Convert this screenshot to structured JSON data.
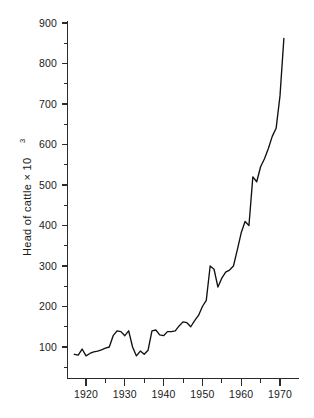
{
  "chart_data": {
    "type": "line",
    "title": "",
    "xlabel": "",
    "ylabel": "Head of cattle × 10",
    "ylabel_exponent": "3",
    "ylabel_full": "Head of cattle × 10³",
    "xlim": [
      1917,
      1972
    ],
    "ylim": [
      0,
      900
    ],
    "yticks_major": [
      100,
      200,
      300,
      400,
      500,
      600,
      700,
      800,
      900
    ],
    "yticks_major_labels": [
      "100",
      "200",
      "300",
      "400",
      "500",
      "600",
      "700",
      "800",
      "900"
    ],
    "yticks_minor": [
      50,
      150,
      250,
      350,
      450,
      550,
      650,
      750,
      850
    ],
    "xticks_major": [
      1920,
      1930,
      1940,
      1950,
      1960,
      1970
    ],
    "xticks_major_labels": [
      "1920",
      "1930",
      "1940",
      "1950",
      "1960",
      "1970"
    ],
    "xticks_minor": [
      1925,
      1935,
      1945,
      1955,
      1965
    ],
    "grid": false,
    "legend": null,
    "series": [
      {
        "name": "Head of cattle",
        "x": [
          1917,
          1918,
          1919,
          1920,
          1921,
          1922,
          1923,
          1924,
          1925,
          1926,
          1927,
          1928,
          1929,
          1930,
          1931,
          1932,
          1933,
          1934,
          1935,
          1936,
          1937,
          1938,
          1939,
          1940,
          1941,
          1942,
          1943,
          1944,
          1945,
          1946,
          1947,
          1948,
          1949,
          1950,
          1951,
          1952,
          1953,
          1954,
          1955,
          1956,
          1957,
          1958,
          1959,
          1960,
          1961,
          1962,
          1963,
          1964,
          1965,
          1966,
          1967,
          1968,
          1969,
          1970,
          1971
        ],
        "y": [
          82,
          80,
          95,
          78,
          84,
          88,
          90,
          93,
          97,
          100,
          128,
          140,
          138,
          128,
          140,
          100,
          78,
          90,
          82,
          92,
          140,
          142,
          130,
          128,
          138,
          138,
          140,
          152,
          162,
          160,
          150,
          165,
          178,
          200,
          215,
          300,
          292,
          248,
          270,
          285,
          290,
          300,
          340,
          382,
          410,
          400,
          520,
          508,
          545,
          565,
          590,
          620,
          640,
          720,
          862
        ],
        "color": "#111111"
      }
    ]
  },
  "axes": {
    "y_axis_name": "y-axis",
    "x_axis_name": "x-axis"
  }
}
